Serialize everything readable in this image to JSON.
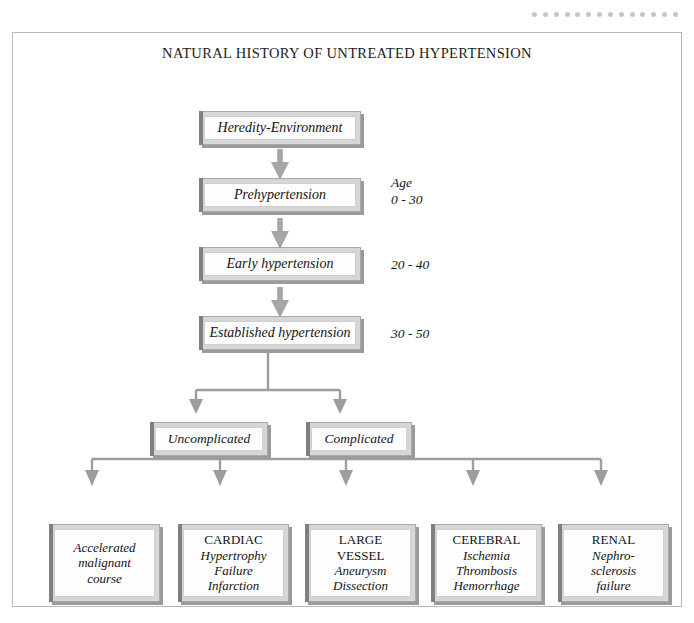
{
  "title": "NATURAL HISTORY OF UNTREATED HYPERTENSION",
  "decoration": {
    "dot_count": 14,
    "dot_color": "#c6c6c6"
  },
  "colors": {
    "frame_border": "#b8b8b8",
    "box_fill": "#d6d6d6",
    "box_inner_fill": "#fdfdfd",
    "box_border": "#a8a8a8",
    "shadow": "#9a9a9a",
    "arrow": "#9d9d9d",
    "connector_line": "#9d9d9d",
    "text": "#141414"
  },
  "stages": [
    {
      "id": "heredity",
      "label": "Heredity-Environment"
    },
    {
      "id": "prehtn",
      "label": "Prehypertension"
    },
    {
      "id": "earlyhtn",
      "label": "Early hypertension"
    },
    {
      "id": "estabhtn",
      "label": "Established hypertension"
    }
  ],
  "age_notes": {
    "heading": "Age",
    "prehypertension": "0 - 30",
    "early_hypertension": "20 - 40",
    "established_hypertension": "30 - 50"
  },
  "outcomes": [
    {
      "id": "uncomplicated",
      "label": "Uncomplicated"
    },
    {
      "id": "complicated",
      "label": "Complicated"
    }
  ],
  "complications": [
    {
      "id": "accelerated",
      "heading": "",
      "heading_style": "none",
      "lines": [
        "Accelerated",
        "malignant",
        "course"
      ],
      "line_style": "italic"
    },
    {
      "id": "cardiac",
      "heading": "CARDIAC",
      "heading_style": "roman",
      "lines": [
        "Hypertrophy",
        "Failure",
        "Infarction"
      ],
      "line_style": "italic"
    },
    {
      "id": "largevessel",
      "heading": "LARGE VESSEL",
      "heading_lines": [
        "LARGE",
        "VESSEL"
      ],
      "heading_style": "roman",
      "lines": [
        "Aneurysm",
        "Dissection"
      ],
      "line_style": "italic"
    },
    {
      "id": "cerebral",
      "heading": "CEREBRAL",
      "heading_style": "roman",
      "lines": [
        "Ischemia",
        "Thrombosis",
        "Hemorrhage"
      ],
      "line_style": "italic"
    },
    {
      "id": "renal",
      "heading": "RENAL",
      "heading_style": "roman",
      "lines": [
        "Nephro-",
        "sclerosis",
        "failure"
      ],
      "line_style": "italic"
    }
  ]
}
